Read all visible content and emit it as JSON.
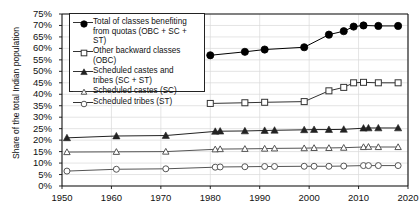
{
  "chart_data": {
    "type": "line",
    "title": "",
    "xlabel": "",
    "ylabel": "Share of the total Indian population",
    "xlim": [
      1950,
      2020
    ],
    "ylim": [
      0,
      0.75
    ],
    "xticks": [
      1950,
      1960,
      1970,
      1980,
      1990,
      2000,
      2010,
      2020
    ],
    "yticks": [
      "0%",
      "5%",
      "10%",
      "15%",
      "20%",
      "25%",
      "30%",
      "35%",
      "40%",
      "45%",
      "50%",
      "55%",
      "60%",
      "65%",
      "70%",
      "75%"
    ],
    "grid": "horizontal-and-vertical-light",
    "legend_position": "upper-left-inside",
    "series": [
      {
        "name": "Total of classes benefiting from quotas (OBC + SC + ST)",
        "marker": "filled-circle",
        "color": "#000000",
        "x": [
          1980,
          1987,
          1991,
          1999,
          2004,
          2007,
          2009,
          2011,
          2014,
          2018
        ],
        "values": [
          57.0,
          58.5,
          59.5,
          60.5,
          66.0,
          67.5,
          69.5,
          70.0,
          69.8,
          69.8
        ]
      },
      {
        "name": "Other backward classes (OBC)",
        "marker": "open-square",
        "color": "#333333",
        "x": [
          1980,
          1987,
          1991,
          1999,
          2004,
          2007,
          2009,
          2011,
          2014,
          2018
        ],
        "values": [
          36.0,
          36.3,
          36.5,
          36.8,
          41.5,
          43.0,
          45.0,
          45.2,
          45.0,
          45.0
        ]
      },
      {
        "name": "Scheduled castes and tribes (SC + ST)",
        "marker": "filled-triangle",
        "color": "#222222",
        "x": [
          1951,
          1961,
          1971,
          1981,
          1982,
          1987,
          1991,
          1993,
          1999,
          2001,
          2004,
          2007,
          2011,
          2012,
          2014,
          2018
        ],
        "values": [
          21.0,
          21.8,
          22.0,
          23.8,
          23.9,
          24.0,
          24.2,
          24.3,
          24.5,
          24.6,
          24.6,
          24.7,
          25.2,
          25.3,
          25.3,
          25.3
        ]
      },
      {
        "name": "Scheduled castes (SC)",
        "marker": "open-triangle",
        "color": "#555555",
        "x": [
          1951,
          1961,
          1971,
          1981,
          1982,
          1987,
          1991,
          1993,
          1999,
          2001,
          2004,
          2007,
          2011,
          2012,
          2014,
          2018
        ],
        "values": [
          14.8,
          14.9,
          15.0,
          16.0,
          16.1,
          16.2,
          16.3,
          16.4,
          16.5,
          16.6,
          16.6,
          16.7,
          17.0,
          17.1,
          17.0,
          17.0
        ]
      },
      {
        "name": "Scheduled tribes (ST)",
        "marker": "open-circle",
        "color": "#555555",
        "x": [
          1951,
          1961,
          1971,
          1981,
          1982,
          1987,
          1991,
          1993,
          1999,
          2001,
          2004,
          2007,
          2011,
          2012,
          2014,
          2018
        ],
        "values": [
          6.5,
          7.3,
          7.5,
          8.2,
          8.3,
          8.4,
          8.5,
          8.5,
          8.6,
          8.6,
          8.6,
          8.7,
          8.9,
          8.9,
          8.9,
          8.9
        ]
      }
    ]
  },
  "legend": {
    "items": [
      {
        "label_line1": "Total of classes benefiting",
        "label_line2": "from quotas (OBC + SC + ST)",
        "marker": "filled-circle"
      },
      {
        "label_line1": "Other backward classes (OBC)",
        "label_line2": "",
        "marker": "open-square"
      },
      {
        "label_line1": "Scheduled castes and",
        "label_line2": "tribes (SC + ST)",
        "marker": "filled-triangle"
      },
      {
        "label_line1": "Scheduled castes (SC)",
        "label_line2": "",
        "marker": "open-triangle"
      },
      {
        "label_line1": "Scheduled tribes (ST)",
        "label_line2": "",
        "marker": "open-circle"
      }
    ]
  }
}
